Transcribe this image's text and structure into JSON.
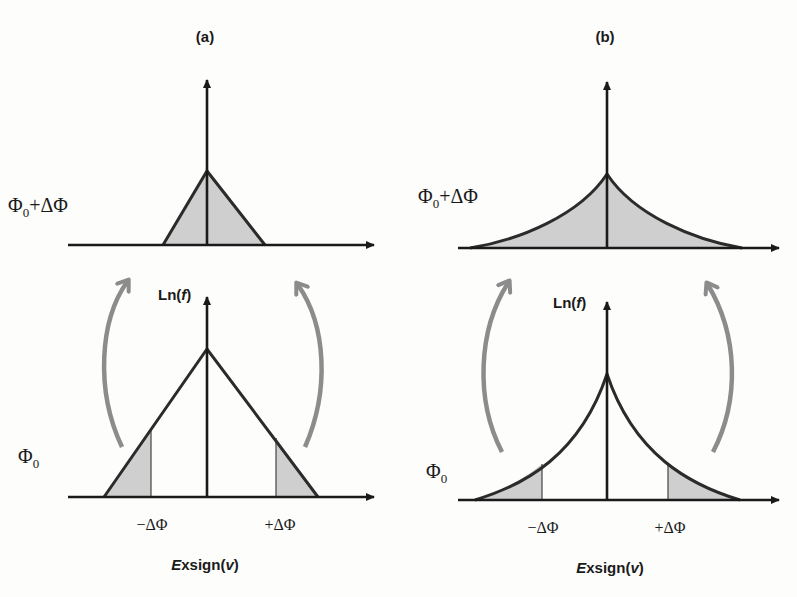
{
  "figure": {
    "panels": [
      {
        "id": "a",
        "title": "(a)",
        "shape": "triangle",
        "top": {
          "label_main": "Φ",
          "label_sub": "0",
          "label_tail": "+ΔΦ"
        },
        "bottom": {
          "y_axis_label_prefix": "Ln(",
          "y_axis_label_var": "f",
          "y_axis_label_suffix": ")",
          "level_label_main": "Φ",
          "level_label_sub": "0",
          "tick_left": "−ΔΦ",
          "tick_right": "+ΔΦ",
          "x_axis_label_prefix": "E",
          "x_axis_label_mid": "xsign(",
          "x_axis_label_var": "v",
          "x_axis_label_suffix": ")"
        }
      },
      {
        "id": "b",
        "title": "(b)",
        "shape": "cusp (exponential tails)",
        "top": {
          "label_main": "Φ",
          "label_sub": "0",
          "label_tail": "+ΔΦ"
        },
        "bottom": {
          "y_axis_label_prefix": "Ln(",
          "y_axis_label_var": "f",
          "y_axis_label_suffix": ")",
          "level_label_main": "Φ",
          "level_label_sub": "0",
          "tick_left": "−ΔΦ",
          "tick_right": "+ΔΦ",
          "x_axis_label_prefix": "E",
          "x_axis_label_mid": "xsign(",
          "x_axis_label_var": "v",
          "x_axis_label_suffix": ")"
        }
      }
    ],
    "colors": {
      "axis": "#1a1a1a",
      "curve": "#2b2b2b",
      "shade": "#cfcfcf",
      "arrow": "#8c8c8c",
      "background": "#fdfdfb"
    }
  }
}
